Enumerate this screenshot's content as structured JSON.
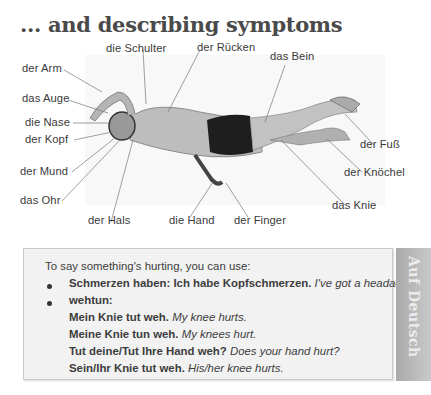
{
  "heading": "... and describing symptoms",
  "figure": {
    "image": "swimmer-body-illustration",
    "labels": {
      "arm": "der Arm",
      "shoulder": "die Schulter",
      "back": "der Rücken",
      "leg": "das Bein",
      "eye": "das Auge",
      "nose": "die Nase",
      "head": "der Kopf",
      "mouth": "der Mund",
      "ear": "das Ohr",
      "neck": "der Hals",
      "hand": "die Hand",
      "finger": "der Finger",
      "foot": "der Fuß",
      "ankle": "der Knöchel",
      "knee": "das Knie"
    }
  },
  "grammar_box": {
    "intro": "To say something's hurting, you can use:",
    "bullet1": {
      "bold": "Schmerzen haben: Ich habe Kopfschmerzen.",
      "italic": "I've got a headache."
    },
    "bullet2": {
      "bold": "wehtun:"
    },
    "examples": [
      {
        "bold": "Mein Knie tut weh.",
        "italic": "My knee hurts."
      },
      {
        "bold": "Meine Knie tun weh.",
        "italic": "My knees hurt."
      },
      {
        "bold": "Tut deine/Tut Ihre Hand weh?",
        "italic": "Does your hand hurt?"
      },
      {
        "bold": "Sein/Ihr Knie tut weh.",
        "italic": "His/her knee hurts."
      }
    ]
  },
  "side_tab": "Auf Deutsch"
}
